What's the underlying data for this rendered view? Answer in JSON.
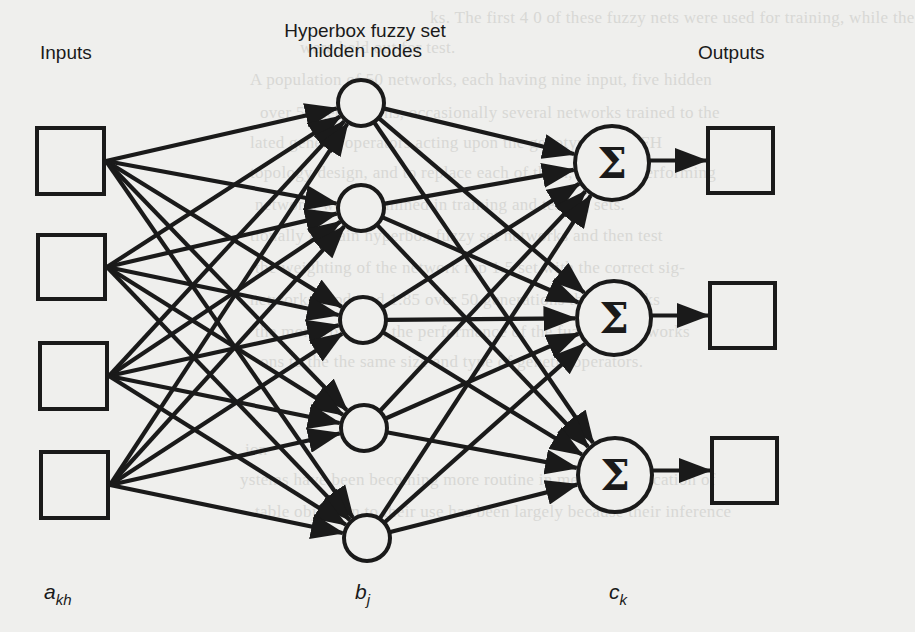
{
  "figure": {
    "column_headers": {
      "inputs": "Inputs",
      "hidden_line1": "Hyperbox fuzzy set",
      "hidden_line2": "hidden nodes",
      "outputs": "Outputs"
    },
    "symbols": {
      "input": {
        "base": "a",
        "sub": "kh"
      },
      "hidden": {
        "base": "b",
        "sub": "j"
      },
      "output": {
        "base": "c",
        "sub": "k"
      }
    },
    "sum_glyph": "Σ",
    "colors": {
      "ink": "#1a1a1a",
      "paper": "#efefed",
      "bleed": "#d8d8d5"
    }
  },
  "chart_data": {
    "type": "diagram",
    "layers": [
      {
        "name": "Inputs",
        "symbol": "a_kh",
        "shape": "square",
        "count": 4
      },
      {
        "name": "Hyperbox fuzzy set hidden nodes",
        "symbol": "b_j",
        "shape": "circle",
        "count": 5
      },
      {
        "name": "Outputs (summation)",
        "symbol": "c_k",
        "shape": "circle-sigma",
        "count": 3
      },
      {
        "name": "Outputs",
        "shape": "square",
        "count": 3
      }
    ],
    "connections": [
      {
        "from": "Inputs",
        "to": "Hidden",
        "pattern": "fully-connected",
        "directed": true
      },
      {
        "from": "Hidden",
        "to": "Sum",
        "pattern": "fully-connected",
        "directed": true
      },
      {
        "from": "Sum",
        "to": "Outputs",
        "pattern": "one-to-one",
        "directed": true
      }
    ],
    "input_nodes": [
      {
        "x": 37,
        "y": 128,
        "w": 67,
        "h": 66
      },
      {
        "x": 38,
        "y": 235,
        "w": 67,
        "h": 64
      },
      {
        "x": 40,
        "y": 343,
        "w": 67,
        "h": 66
      },
      {
        "x": 41,
        "y": 452,
        "w": 67,
        "h": 66
      }
    ],
    "hidden_nodes": [
      {
        "cx": 361,
        "cy": 103,
        "r": 23
      },
      {
        "cx": 361,
        "cy": 208,
        "r": 23
      },
      {
        "cx": 363,
        "cy": 320,
        "r": 23
      },
      {
        "cx": 364,
        "cy": 428,
        "r": 23
      },
      {
        "cx": 367,
        "cy": 538,
        "r": 23
      }
    ],
    "sum_nodes": [
      {
        "cx": 612,
        "cy": 163,
        "r": 37
      },
      {
        "cx": 614,
        "cy": 318,
        "r": 37
      },
      {
        "cx": 615,
        "cy": 475,
        "r": 37
      }
    ],
    "output_nodes": [
      {
        "x": 708,
        "y": 128,
        "w": 65,
        "h": 65
      },
      {
        "x": 710,
        "y": 283,
        "w": 65,
        "h": 65
      },
      {
        "x": 712,
        "y": 438,
        "w": 65,
        "h": 65
      }
    ]
  },
  "background_bleed": [
    "ks. The first 4 0 of these fuzzy nets were used for training, while the",
    "were held out for test.",
    "A population of 50 networks, each having nine input, five hidden",
    "over 50 generations, occasionally several networks trained to the",
    "lated genetic operators acting upon the genotypes of MFH",
    "topology design, and to replace each of them, the best performing",
    "network, were examined in training and testing sets.",
    "tionally to train hyperbox fuzzy set networks and then test",
    "the weighting of the network rep 1.5 set with the correct sig-",
    "networks produced 1.85 over 50 generations the networks",
    "the more complex, the performance of the fuzzy set networks",
    "ons to the the same size and type of genetic operators.",
    "ion",
    "ystems have been becoming more routine in medical application of",
    "table objection to their use has been largely because their inference"
  ]
}
